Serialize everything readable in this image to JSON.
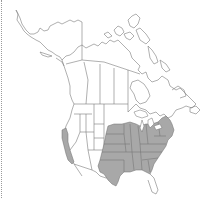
{
  "map": {
    "region": "North America",
    "type": "species distribution map",
    "colors": {
      "background": "#ffffff",
      "boundary": "#7a7a7a",
      "range_fill": "#a8a8a8",
      "range_state_lines": "#6e6e6e",
      "frame_border": "#9a9a9a"
    },
    "shaded_regions": [
      "eastern-central-united-states",
      "california-coastal-strip"
    ],
    "labels": []
  }
}
